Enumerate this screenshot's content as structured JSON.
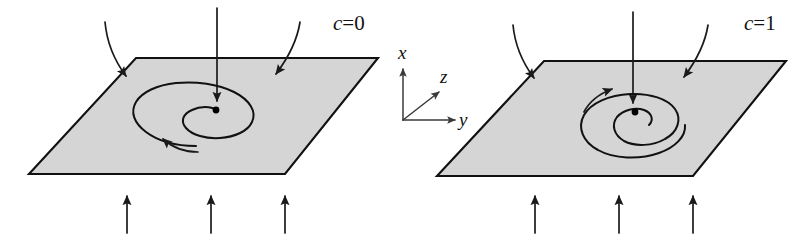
{
  "figure": {
    "background_color": "#ffffff",
    "plane_fill_color": "#d5d5d5",
    "stroke_color": "#111111",
    "width": 810,
    "height": 240
  },
  "axes": {
    "origin": {
      "x": 403,
      "y": 120
    },
    "x_label": "x",
    "y_label": "y",
    "z_label": "z"
  },
  "panels": [
    {
      "id": "left",
      "case_label_var": "c",
      "case_label_eq": "=",
      "case_label_value": "0",
      "case_label_full": "c=0",
      "spiral_type": "inward",
      "spiral_direction": "counterclockwise",
      "fixed_point": {
        "x": 216,
        "y": 110
      },
      "plane_vertices": "136,58 378,58 285,174 29,174",
      "inflow_arrow_count": 3,
      "center_arrow_count": 1,
      "upflow_arrow_count": 3
    },
    {
      "id": "right",
      "case_label_var": "c",
      "case_label_eq": "=",
      "case_label_value": "1",
      "case_label_full": "c=1",
      "spiral_type": "outward",
      "spiral_direction": "clockwise",
      "fixed_point": {
        "x": 635,
        "y": 112
      },
      "plane_vertices": "544,61 786,61 693,176 437,176",
      "inflow_arrow_count": 3,
      "center_arrow_count": 1,
      "upflow_arrow_count": 3
    }
  ]
}
